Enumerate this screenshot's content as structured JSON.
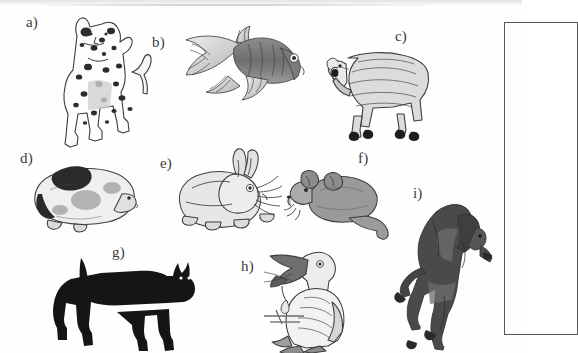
{
  "plate": {
    "title": "Animal identification figure plate",
    "description": "Scanned black-and-white plate with nine labelled animal illustrations",
    "background_color": "#fefefe",
    "ink_color": "#3a3a3a",
    "label_suffix": ")"
  },
  "figures": [
    {
      "key": "a",
      "label": "a)",
      "subject": "dalmatian-dog",
      "icon": "dog-icon",
      "label_x": 26,
      "label_y": 14,
      "art_x": 44,
      "art_y": 10,
      "art_w": 116,
      "art_h": 130
    },
    {
      "key": "b",
      "label": "b)",
      "subject": "goldfish",
      "icon": "fish-icon",
      "label_x": 152,
      "label_y": 34,
      "art_x": 172,
      "art_y": 24,
      "art_w": 132,
      "art_h": 86
    },
    {
      "key": "c",
      "label": "c)",
      "subject": "sheep",
      "icon": "sheep-icon",
      "label_x": 395,
      "label_y": 28,
      "art_x": 318,
      "art_y": 40,
      "art_w": 116,
      "art_h": 102
    },
    {
      "key": "d",
      "label": "d)",
      "subject": "guinea-pig",
      "icon": "guinea-pig-icon",
      "label_x": 20,
      "label_y": 150,
      "art_x": 26,
      "art_y": 164,
      "art_w": 110,
      "art_h": 68
    },
    {
      "key": "e",
      "label": "e)",
      "subject": "rabbit",
      "icon": "rabbit-icon",
      "label_x": 160,
      "label_y": 155,
      "art_x": 172,
      "art_y": 148,
      "art_w": 108,
      "art_h": 90
    },
    {
      "key": "f",
      "label": "f)",
      "subject": "mouse",
      "icon": "mouse-icon",
      "label_x": 358,
      "label_y": 150,
      "art_x": 284,
      "art_y": 166,
      "art_w": 104,
      "art_h": 72
    },
    {
      "key": "g",
      "label": "g)",
      "subject": "black-cat",
      "icon": "cat-icon",
      "label_x": 112,
      "label_y": 244,
      "art_x": 55,
      "art_y": 250,
      "art_w": 140,
      "art_h": 95
    },
    {
      "key": "h",
      "label": "h)",
      "subject": "pelican",
      "icon": "pelican-icon",
      "label_x": 241,
      "label_y": 258,
      "art_x": 258,
      "art_y": 238,
      "art_w": 102,
      "art_h": 112
    },
    {
      "key": "i",
      "label": "i)",
      "subject": "rearing-horse",
      "icon": "horse-icon",
      "label_x": 413,
      "label_y": 185,
      "art_x": 392,
      "art_y": 198,
      "art_w": 110,
      "art_h": 150
    }
  ],
  "bracket": {
    "name": "answer-box",
    "x": 504,
    "y": 22,
    "width": 72,
    "height": 311,
    "border_color": "#555555"
  }
}
